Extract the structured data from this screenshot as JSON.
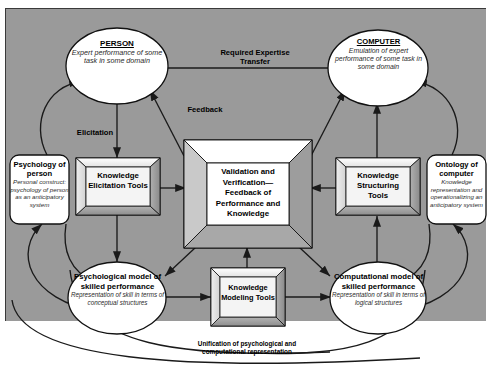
{
  "diagram": {
    "colors": {
      "panel_background": "#9a9a9a",
      "node_fill": "#ffffff",
      "node_stroke": "#000000",
      "box_face": "#f2f2f2",
      "box_bevel_light": "#ffffff",
      "box_bevel_dark": "#8c8c8c",
      "page_background": "#ffffff"
    },
    "nodes": {
      "person": {
        "shape": "ellipse",
        "title": "PERSON",
        "subtitle": "Expert performance of some task in some domain"
      },
      "computer": {
        "shape": "ellipse",
        "title": "COMPUTER",
        "subtitle": "Emulation of expert performance of some task in some domain"
      },
      "psychology_of_person": {
        "shape": "rounded-rect",
        "title": "Psychology of person",
        "subtitle": "Personal construct: psychology of person as an anticipatory system"
      },
      "ontology_of_computer": {
        "shape": "rounded-rect",
        "title": "Ontology of computer",
        "subtitle": "Knowledge representation and operationalizing an anticipatory system"
      },
      "knowledge_elicitation_tools": {
        "shape": "beveled-box",
        "title": "Knowledge Elicitation Tools"
      },
      "knowledge_structuring_tools": {
        "shape": "beveled-box",
        "title": "Knowledge Structuring Tools"
      },
      "knowledge_modeling_tools": {
        "shape": "beveled-box",
        "title": "Knowledge Modeling Tools"
      },
      "validation_and_verification": {
        "shape": "beveled-frame",
        "title": "Validation and Verification— Feedback of Performance and Knowledge"
      },
      "psychological_model": {
        "shape": "ellipse",
        "title": "Psychological model of skilled performance",
        "subtitle": "Representation of skill in terms of conceptual structures"
      },
      "computational_model": {
        "shape": "ellipse",
        "title": "Computational model of skilled performance",
        "subtitle": "Representation of skill in terms of logical structures"
      }
    },
    "edge_labels": {
      "required_expertise_transfer": "Required Expertise Transfer",
      "feedback": "Feedback",
      "elicitation": "Elicitation",
      "unification": "Unification of psychological and computational representation"
    }
  }
}
